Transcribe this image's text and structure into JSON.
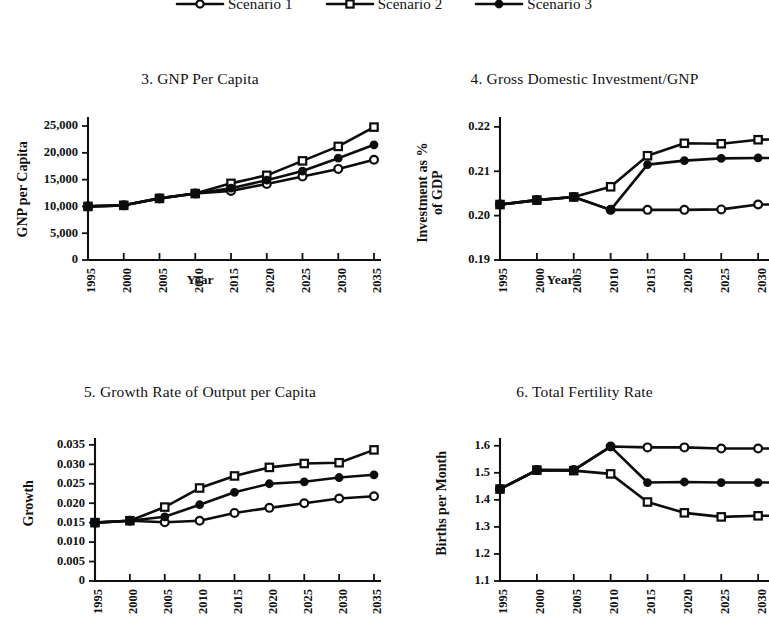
{
  "legend": {
    "entries": [
      {
        "label": "Scenario 1",
        "marker": "open-circle"
      },
      {
        "label": "Scenario 2",
        "marker": "open-square"
      },
      {
        "label": "Scenario 3",
        "marker": "filled-dot"
      }
    ]
  },
  "panels": [
    {
      "title": "3. GNP Per Capita"
    },
    {
      "title": "4. Gross Domestic Investment/GNP"
    },
    {
      "title": "5. Growth Rate of Output per Capita"
    },
    {
      "title": "6. Total Fertility Rate"
    }
  ],
  "chart_data": [
    {
      "type": "line",
      "title": "3. GNP Per Capita",
      "xlabel": "Year",
      "ylabel": "GNP per Capita",
      "x": [
        1995,
        2000,
        2005,
        2010,
        2015,
        2020,
        2025,
        2030,
        2035
      ],
      "xticklabels": [
        "1995",
        "2000",
        "2005",
        "2010",
        "2015",
        "2020",
        "2025",
        "2030",
        "2035"
      ],
      "yticklabels": [
        "0",
        "5,000",
        "10,000",
        "15,000",
        "20,000",
        "25,000"
      ],
      "yticks": [
        0,
        5000,
        10000,
        15000,
        20000,
        25000
      ],
      "ylim": [
        0,
        26500
      ],
      "grid": false,
      "legend_position": "top-shared",
      "series": [
        {
          "name": "Scenario 1",
          "marker": "open-circle",
          "values": [
            10000,
            10200,
            11500,
            12400,
            12900,
            14200,
            15600,
            17000,
            18700
          ]
        },
        {
          "name": "Scenario 2",
          "marker": "open-square",
          "values": [
            10000,
            10200,
            11500,
            12400,
            14300,
            15800,
            18500,
            21200,
            24800
          ]
        },
        {
          "name": "Scenario 3",
          "marker": "filled-dot",
          "values": [
            10000,
            10200,
            11500,
            12400,
            13400,
            14900,
            16600,
            19000,
            21500
          ]
        }
      ]
    },
    {
      "type": "line",
      "title": "4. Gross Domestic Investment/GNP",
      "xlabel": "Year",
      "ylabel": "Investment as % of GDP",
      "x": [
        1995,
        2000,
        2005,
        2010,
        2015,
        2020,
        2025,
        2030,
        2035
      ],
      "xticklabels": [
        "1995",
        "2000",
        "2005",
        "2010",
        "2015",
        "2020",
        "2025",
        "2030",
        "2035"
      ],
      "yticklabels": [
        "0.19",
        "0.20",
        "0.21",
        "0.22"
      ],
      "yticks": [
        0.19,
        0.2,
        0.21,
        0.22
      ],
      "ylim": [
        0.19,
        0.222
      ],
      "grid": false,
      "legend_position": "top-shared",
      "note": "right edge of panel clipped by page crop",
      "series": [
        {
          "name": "Scenario 1",
          "marker": "open-circle",
          "values": [
            0.2025,
            0.2035,
            0.2042,
            0.2013,
            0.2013,
            0.2013,
            0.2014,
            0.2025,
            0.2025
          ]
        },
        {
          "name": "Scenario 2",
          "marker": "open-square",
          "values": [
            0.2025,
            0.2035,
            0.2042,
            0.2065,
            0.2135,
            0.2163,
            0.2162,
            0.2171,
            0.2173
          ]
        },
        {
          "name": "Scenario 3",
          "marker": "filled-dot",
          "values": [
            0.2025,
            0.2035,
            0.2042,
            0.2013,
            0.2115,
            0.2124,
            0.2129,
            0.213,
            0.213
          ]
        }
      ]
    },
    {
      "type": "line",
      "title": "5. Growth Rate of Output per Capita",
      "xlabel": "Year",
      "ylabel": "Growth",
      "x": [
        1995,
        2000,
        2005,
        2010,
        2015,
        2020,
        2025,
        2030,
        2035
      ],
      "xticklabels": [
        "1995",
        "2000",
        "2005",
        "2010",
        "2015",
        "2020",
        "2025",
        "2030",
        "2035"
      ],
      "yticklabels": [
        "0",
        "0.005",
        "0.010",
        "0.015",
        "0.020",
        "0.025",
        "0.030",
        "0.035"
      ],
      "yticks": [
        0,
        0.005,
        0.01,
        0.015,
        0.02,
        0.025,
        0.03,
        0.035
      ],
      "ylim": [
        0,
        0.0365
      ],
      "grid": false,
      "legend_position": "top-shared",
      "series": [
        {
          "name": "Scenario 1",
          "marker": "open-circle",
          "values": [
            0.015,
            0.0155,
            0.0151,
            0.0155,
            0.0175,
            0.0188,
            0.02,
            0.0212,
            0.0218
          ]
        },
        {
          "name": "Scenario 2",
          "marker": "open-square",
          "values": [
            0.015,
            0.0155,
            0.019,
            0.0239,
            0.027,
            0.0292,
            0.0302,
            0.0304,
            0.0337
          ]
        },
        {
          "name": "Scenario 3",
          "marker": "filled-dot",
          "values": [
            0.015,
            0.0155,
            0.0165,
            0.0196,
            0.0228,
            0.025,
            0.0255,
            0.0266,
            0.0273
          ]
        }
      ]
    },
    {
      "type": "line",
      "title": "6. Total Fertility Rate",
      "xlabel": "Year",
      "ylabel": "Births per Month",
      "x": [
        1995,
        2000,
        2005,
        2010,
        2015,
        2020,
        2025,
        2030,
        2035
      ],
      "xticklabels": [
        "1995",
        "2000",
        "2005",
        "2010",
        "2015",
        "2020",
        "2025",
        "2030",
        "2035"
      ],
      "yticklabels": [
        "1.1",
        "1.2",
        "1.3",
        "1.4",
        "1.5",
        "1.6"
      ],
      "yticks": [
        1.1,
        1.2,
        1.3,
        1.4,
        1.5,
        1.6
      ],
      "ylim": [
        1.1,
        1.625
      ],
      "grid": false,
      "legend_position": "top-shared",
      "note": "right edge of panel clipped by page crop",
      "series": [
        {
          "name": "Scenario 1",
          "marker": "open-circle",
          "values": [
            1.44,
            1.51,
            1.51,
            1.597,
            1.594,
            1.594,
            1.59,
            1.59,
            1.59
          ]
        },
        {
          "name": "Scenario 2",
          "marker": "open-square",
          "values": [
            1.44,
            1.51,
            1.508,
            1.496,
            1.392,
            1.352,
            1.337,
            1.341,
            1.341
          ]
        },
        {
          "name": "Scenario 3",
          "marker": "filled-dot",
          "values": [
            1.44,
            1.51,
            1.51,
            1.597,
            1.464,
            1.466,
            1.464,
            1.464,
            1.464
          ]
        }
      ]
    }
  ]
}
